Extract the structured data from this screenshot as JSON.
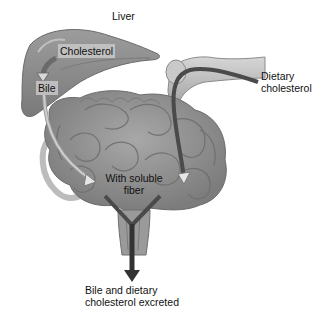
{
  "diagram": {
    "labels": {
      "liver": "Liver",
      "cholesterol": "Cholesterol",
      "bile": "Bile",
      "dietary_line1": "Dietary",
      "dietary_line2": "cholesterol",
      "fiber_line1": "With soluble",
      "fiber_line2": "fiber",
      "excreted_line1": "Bile and dietary",
      "excreted_line2": "cholesterol excreted"
    },
    "nodes": [
      {
        "id": "liver",
        "label": "Liver"
      },
      {
        "id": "cholesterol",
        "label": "Cholesterol"
      },
      {
        "id": "bile",
        "label": "Bile"
      },
      {
        "id": "dietary",
        "label": "Dietary cholesterol"
      },
      {
        "id": "fiber",
        "label": "With soluble fiber"
      },
      {
        "id": "excreted",
        "label": "Bile and dietary cholesterol excreted"
      }
    ],
    "edges": [
      {
        "from": "cholesterol",
        "to": "bile"
      },
      {
        "from": "bile",
        "to": "fiber"
      },
      {
        "from": "dietary",
        "to": "fiber"
      },
      {
        "from": "fiber",
        "to": "excreted"
      }
    ],
    "colors": {
      "organ_fill": "#8c8c8c",
      "organ_dark": "#6e6e6e",
      "organ_light": "#b3b3b3",
      "pathway": "#4a4a4a",
      "arrow_outline": "#9a9a9a",
      "label_bg": "#c8c8c8"
    }
  }
}
